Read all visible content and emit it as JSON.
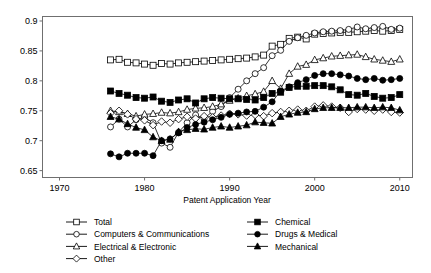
{
  "chart_data": {
    "type": "line",
    "title": "",
    "xlabel": "Patent Application Year",
    "ylabel": "",
    "xlim": [
      1968,
      2011.5
    ],
    "ylim": [
      0.6385,
      0.9075
    ],
    "grid": false,
    "legend_position": "below",
    "xticks": [
      1970,
      1980,
      1990,
      2000,
      2010
    ],
    "xtick_labels": [
      "1970",
      "1980",
      "1990",
      "2000",
      "2010"
    ],
    "yticks": [
      0.65,
      0.7,
      0.75,
      0.8,
      0.85,
      0.9
    ],
    "ytick_labels": [
      "0.65",
      "0.7",
      "0.75",
      "0.8",
      "0.85",
      "0.9"
    ],
    "x": [
      1976,
      1977,
      1978,
      1979,
      1980,
      1981,
      1982,
      1983,
      1984,
      1985,
      1986,
      1987,
      1988,
      1989,
      1990,
      1991,
      1992,
      1993,
      1994,
      1995,
      1996,
      1997,
      1998,
      1999,
      2000,
      2001,
      2002,
      2003,
      2004,
      2005,
      2006,
      2007,
      2008,
      2009,
      2010
    ],
    "series": [
      {
        "name": "Total",
        "marker": "square-open",
        "values": [
          0.835,
          0.836,
          0.831,
          0.83,
          0.828,
          0.826,
          0.829,
          0.828,
          0.83,
          0.831,
          0.832,
          0.833,
          0.834,
          0.835,
          0.836,
          0.837,
          0.838,
          0.84,
          0.843,
          0.858,
          0.861,
          0.871,
          0.873,
          0.87,
          0.878,
          0.879,
          0.88,
          0.881,
          0.881,
          0.882,
          0.883,
          0.884,
          0.883,
          0.884,
          0.886
        ]
      },
      {
        "name": "Computers & Communications",
        "marker": "circle-open",
        "values": [
          0.723,
          0.736,
          0.723,
          0.735,
          0.739,
          0.73,
          0.696,
          0.689,
          0.714,
          0.73,
          0.743,
          0.737,
          0.749,
          0.757,
          0.772,
          0.786,
          0.8,
          0.812,
          0.822,
          0.842,
          0.851,
          0.866,
          0.872,
          0.876,
          0.88,
          0.882,
          0.883,
          0.884,
          0.886,
          0.89,
          0.887,
          0.889,
          0.891,
          0.886,
          0.888
        ]
      },
      {
        "name": "Electrical & Electronic",
        "marker": "triangle-open",
        "values": [
          0.75,
          0.748,
          0.745,
          0.741,
          0.744,
          0.745,
          0.747,
          0.746,
          0.748,
          0.752,
          0.754,
          0.755,
          0.757,
          0.761,
          0.767,
          0.771,
          0.775,
          0.778,
          0.782,
          0.8,
          0.787,
          0.812,
          0.824,
          0.827,
          0.835,
          0.838,
          0.841,
          0.842,
          0.843,
          0.844,
          0.84,
          0.836,
          0.834,
          0.832,
          0.836
        ]
      },
      {
        "name": "Other",
        "marker": "diamond-open",
        "values": [
          0.746,
          0.75,
          0.744,
          0.736,
          0.734,
          0.726,
          0.732,
          0.73,
          0.736,
          0.74,
          0.737,
          0.741,
          0.739,
          0.742,
          0.745,
          0.744,
          0.742,
          0.743,
          0.741,
          0.746,
          0.748,
          0.75,
          0.752,
          0.75,
          0.757,
          0.759,
          0.757,
          0.755,
          0.748,
          0.753,
          0.752,
          0.75,
          0.752,
          0.748,
          0.747
        ]
      },
      {
        "name": "Chemical",
        "marker": "square-filled",
        "values": [
          0.783,
          0.779,
          0.776,
          0.772,
          0.771,
          0.773,
          0.766,
          0.764,
          0.768,
          0.77,
          0.763,
          0.77,
          0.772,
          0.771,
          0.77,
          0.77,
          0.769,
          0.768,
          0.772,
          0.779,
          0.781,
          0.789,
          0.791,
          0.791,
          0.792,
          0.792,
          0.79,
          0.785,
          0.777,
          0.776,
          0.779,
          0.774,
          0.771,
          0.772,
          0.777
        ]
      },
      {
        "name": "Drugs & Medical",
        "marker": "circle-filled",
        "values": [
          0.678,
          0.673,
          0.679,
          0.679,
          0.679,
          0.675,
          0.7,
          0.703,
          0.713,
          0.722,
          0.727,
          0.731,
          0.735,
          0.739,
          0.744,
          0.746,
          0.748,
          0.749,
          0.756,
          0.765,
          0.783,
          0.79,
          0.797,
          0.802,
          0.809,
          0.812,
          0.812,
          0.81,
          0.808,
          0.804,
          0.802,
          0.804,
          0.801,
          0.802,
          0.804
        ]
      },
      {
        "name": "Mechanical",
        "marker": "triangle-filled",
        "values": [
          0.74,
          0.736,
          0.728,
          0.722,
          0.718,
          0.706,
          0.7,
          0.702,
          0.715,
          0.718,
          0.72,
          0.719,
          0.722,
          0.724,
          0.722,
          0.724,
          0.726,
          0.731,
          0.73,
          0.729,
          0.74,
          0.744,
          0.747,
          0.748,
          0.753,
          0.755,
          0.755,
          0.755,
          0.755,
          0.756,
          0.756,
          0.755,
          0.756,
          0.755,
          0.751
        ]
      }
    ]
  },
  "legend": {
    "items": [
      {
        "label": "Total",
        "marker": "square-open",
        "column": 0
      },
      {
        "label": "Computers & Communications",
        "marker": "circle-open",
        "column": 0
      },
      {
        "label": "Electrical & Electronic",
        "marker": "triangle-open",
        "column": 0
      },
      {
        "label": "Other",
        "marker": "diamond-open",
        "column": 0
      },
      {
        "label": "Chemical",
        "marker": "square-filled",
        "column": 1
      },
      {
        "label": "Drugs & Medical",
        "marker": "circle-filled",
        "column": 1
      },
      {
        "label": "Mechanical",
        "marker": "triangle-filled",
        "column": 1
      }
    ]
  },
  "colors": {
    "line": "#000000",
    "frame": "#6f6f6f",
    "background": "#ffffff"
  }
}
